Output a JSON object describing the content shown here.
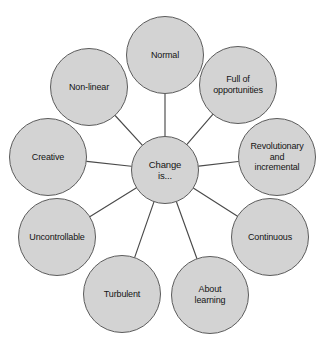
{
  "diagram": {
    "type": "radial-hub-and-spoke",
    "title": "Change is...",
    "background_color": "#ffffff",
    "node_fill_color": "#d3d3d3",
    "node_stroke_color": "#5c5c5c",
    "connector_color": "#4a4a4a",
    "text_color": "#141414",
    "center": {
      "id": "center",
      "label": "Change\nis...",
      "label_plain": "Change is...",
      "cx": 165,
      "cy": 170,
      "r": 34
    },
    "nodes": [
      {
        "id": "normal",
        "label": "Normal",
        "label_plain": "Normal",
        "cx": 165,
        "cy": 55,
        "r": 39
      },
      {
        "id": "full-of-opportunities",
        "label": "Full of\nopportunities",
        "label_plain": "Full of opportunities",
        "cx": 238,
        "cy": 85,
        "r": 39
      },
      {
        "id": "revolutionary-and-incremental",
        "label": "Revolutionary\nand\nincremental",
        "label_plain": "Revolutionary and incremental",
        "cx": 277,
        "cy": 157,
        "r": 39
      },
      {
        "id": "continuous",
        "label": "Continuous",
        "label_plain": "Continuous",
        "cx": 270,
        "cy": 237,
        "r": 39
      },
      {
        "id": "about-learning",
        "label": "About\nlearning",
        "label_plain": "About learning",
        "cx": 210,
        "cy": 295,
        "r": 39
      },
      {
        "id": "turbulent",
        "label": "Turbulent",
        "label_plain": "Turbulent",
        "cx": 122,
        "cy": 294,
        "r": 39
      },
      {
        "id": "uncontrollable",
        "label": "Uncontrollable",
        "label_plain": "Uncontrollable",
        "cx": 57,
        "cy": 237,
        "r": 39
      },
      {
        "id": "creative",
        "label": "Creative",
        "label_plain": "Creative",
        "cx": 48,
        "cy": 157,
        "r": 39
      },
      {
        "id": "non-linear",
        "label": "Non-linear",
        "label_plain": "Non-linear",
        "cx": 89,
        "cy": 87,
        "r": 39
      }
    ],
    "edges": [
      {
        "from": "center",
        "to": "normal"
      },
      {
        "from": "center",
        "to": "full-of-opportunities"
      },
      {
        "from": "center",
        "to": "revolutionary-and-incremental"
      },
      {
        "from": "center",
        "to": "continuous"
      },
      {
        "from": "center",
        "to": "about-learning"
      },
      {
        "from": "center",
        "to": "turbulent"
      },
      {
        "from": "center",
        "to": "uncontrollable"
      },
      {
        "from": "center",
        "to": "creative"
      },
      {
        "from": "center",
        "to": "non-linear"
      }
    ]
  }
}
